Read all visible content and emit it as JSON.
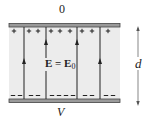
{
  "figure": {
    "type": "parallel-plate-capacitor",
    "top_plate": {
      "potential_label": "0",
      "charge_sign": "+",
      "charge_positions_x": [
        14,
        29,
        38,
        51,
        60,
        70,
        82,
        92,
        108
      ]
    },
    "bottom_plate": {
      "potential_label": "V",
      "charge_sign": "−",
      "charge_positions_x": [
        13,
        20,
        31,
        38,
        52,
        59,
        66,
        73,
        85,
        92,
        106,
        113
      ]
    },
    "field_label": {
      "main": "E = E",
      "subscript": "0"
    },
    "separation_label": "d",
    "field_lines": [
      {
        "x": 24,
        "arrow_y": 62,
        "direction": "up"
      },
      {
        "x": 46,
        "arrow_y": 43,
        "direction": "up"
      },
      {
        "x": 77,
        "arrow_y": 43,
        "direction": "up"
      },
      {
        "x": 100,
        "arrow_y": 62,
        "direction": "up"
      }
    ],
    "colors": {
      "plate": "#555555",
      "plate_fill": "#9a9a9a",
      "gap_background": "#ececec",
      "line": "#222222"
    }
  }
}
